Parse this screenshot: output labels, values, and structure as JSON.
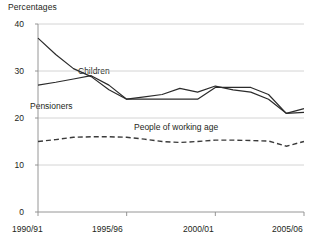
{
  "chart_data": {
    "type": "line",
    "title": "Percentages",
    "xlabel": "",
    "ylabel": "",
    "ylim": [
      0,
      40
    ],
    "yticks": [
      0,
      10,
      20,
      30,
      40
    ],
    "grid": true,
    "legend_position": "inline-annotations",
    "x": [
      "1990/91",
      "1991/92",
      "1992/93",
      "1993/94",
      "1994/95",
      "1995/96",
      "1996/97",
      "1997/98",
      "1998/99",
      "1999/00",
      "2000/01",
      "2001/02",
      "2002/03",
      "2003/04",
      "2004/05",
      "2005/06"
    ],
    "xticks": [
      "1990/91",
      "1995/96",
      "2000/01",
      "2005/06"
    ],
    "series": [
      {
        "name": "Pensioners",
        "style": "solid",
        "color": "#2b2b2b",
        "values": [
          37.0,
          33.5,
          30.5,
          28.8,
          26.0,
          24.0,
          24.0,
          24.0,
          24.0,
          24.0,
          26.5,
          26.5,
          26.5,
          25.0,
          21.0,
          22.0
        ]
      },
      {
        "name": "Children",
        "style": "solid",
        "color": "#2b2b2b",
        "values": [
          27.0,
          27.6,
          28.3,
          29.0,
          27.0,
          24.0,
          24.5,
          25.0,
          26.3,
          25.5,
          26.8,
          26.0,
          25.5,
          24.0,
          21.0,
          21.2
        ]
      },
      {
        "name": "People of working age",
        "style": "dashed",
        "color": "#3a3a3a",
        "values": [
          15.0,
          15.4,
          15.9,
          16.0,
          16.0,
          15.9,
          15.5,
          15.0,
          14.8,
          15.0,
          15.3,
          15.3,
          15.2,
          15.1,
          14.0,
          15.0
        ]
      }
    ],
    "annotations": [
      {
        "text": "Children",
        "x_px": 78,
        "y_px": 66
      },
      {
        "text": "Pensioners",
        "x_px": 30,
        "y_px": 101
      },
      {
        "text": "People of working age",
        "x_px": 134,
        "y_px": 122
      }
    ]
  },
  "axis": {
    "title": "Percentages",
    "y_labels": [
      "40",
      "30",
      "20",
      "10",
      "0"
    ],
    "x_labels": [
      "1990/91",
      "1995/96",
      "2000/01",
      "2005/06"
    ]
  }
}
